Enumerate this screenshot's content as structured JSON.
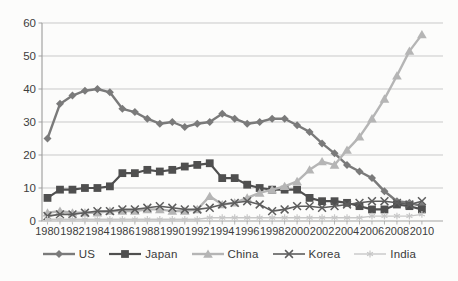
{
  "chart_data": {
    "type": "line",
    "title": "",
    "xlabel": "",
    "ylabel": "",
    "x": [
      1980,
      1981,
      1982,
      1983,
      1984,
      1985,
      1986,
      1987,
      1988,
      1989,
      1990,
      1991,
      1992,
      1993,
      1994,
      1995,
      1996,
      1997,
      1998,
      1999,
      2000,
      2001,
      2002,
      2003,
      2004,
      2005,
      2006,
      2007,
      2008,
      2009,
      2010
    ],
    "x_tick_labels": [
      "1980",
      "1982",
      "1984",
      "1986",
      "1988",
      "1990",
      "1992",
      "1994",
      "1996",
      "1998",
      "2000",
      "2002",
      "2004",
      "2006",
      "2008",
      "2010"
    ],
    "y_ticks": [
      0,
      10,
      20,
      30,
      40,
      50,
      60
    ],
    "ylim": [
      0,
      60
    ],
    "grid": "horizontal",
    "legend_position": "bottom",
    "axis_color": "#a3a3a3",
    "grid_color": "#c9c9c9",
    "tick_label_color": "#3d3d3d",
    "series": [
      {
        "name": "US",
        "marker": "diamond",
        "color": "#7a7a7a",
        "line_width": 2.4,
        "values": [
          25,
          35.5,
          38,
          39.5,
          40,
          39,
          34,
          33,
          31,
          29.5,
          30,
          28.5,
          29.5,
          30,
          32.5,
          31,
          29.5,
          30,
          31,
          31,
          29,
          27,
          23.5,
          20.5,
          17,
          15,
          13,
          9,
          6,
          5.5,
          4.5
        ]
      },
      {
        "name": "Japan",
        "marker": "square",
        "color": "#4f4f4f",
        "line_width": 2.2,
        "values": [
          7,
          9.5,
          9.5,
          10,
          10,
          10.5,
          14.5,
          14.5,
          15.5,
          15,
          15.5,
          16.5,
          17,
          17.5,
          13,
          13,
          11,
          10,
          9.5,
          9.5,
          9.5,
          7,
          6,
          6,
          5.5,
          4.5,
          3.5,
          3.5,
          5,
          4.5,
          3.5
        ]
      },
      {
        "name": "China",
        "marker": "triangle",
        "color": "#b5b5b5",
        "line_width": 2.4,
        "values": [
          2.5,
          3,
          2.5,
          2.5,
          2.5,
          3,
          3,
          3,
          3.5,
          3.5,
          3,
          3,
          3.5,
          7.5,
          5,
          5.5,
          7,
          8.5,
          9.5,
          10.5,
          12,
          15.5,
          18,
          17,
          21.5,
          25.5,
          31,
          37,
          44,
          51.5,
          56.5
        ]
      },
      {
        "name": "Korea",
        "marker": "x",
        "color": "#5d5d5d",
        "line_width": 1.6,
        "values": [
          1.5,
          2,
          2,
          2.5,
          3,
          3,
          3.5,
          3.5,
          4,
          4.5,
          4,
          3.5,
          3.5,
          4,
          5,
          5.5,
          6,
          5,
          3,
          3.5,
          4.5,
          4.5,
          4,
          4.5,
          5,
          5.5,
          6,
          6,
          5.5,
          5,
          6
        ]
      },
      {
        "name": "India",
        "marker": "asterisk",
        "color": "#c7c7c7",
        "line_width": 1.4,
        "values": [
          0.5,
          0.5,
          0.5,
          0.5,
          0.5,
          0.5,
          0.5,
          0.5,
          0.5,
          0.5,
          0.5,
          0.5,
          0.5,
          1,
          1,
          1,
          1,
          1,
          1,
          1,
          1,
          1,
          1,
          1,
          1,
          1,
          1.5,
          1.5,
          1.5,
          1.5,
          2
        ]
      }
    ]
  }
}
